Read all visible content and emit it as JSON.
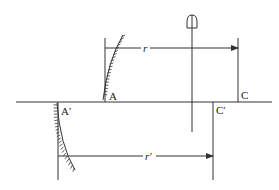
{
  "diagram": {
    "type": "optics-mirror-rotation",
    "labels": {
      "A": "A",
      "A_prime": "A′",
      "C": "C",
      "C_prime": "C′",
      "r": "r",
      "r_prime": "r′"
    },
    "colors": {
      "line": "#333333",
      "text": "#222222",
      "background": "#ffffff"
    }
  }
}
